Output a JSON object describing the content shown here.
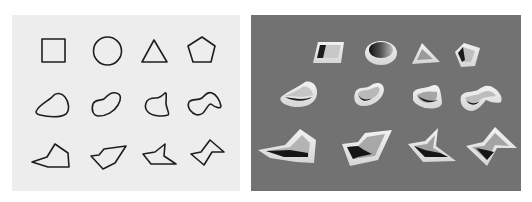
{
  "figure": {
    "left_panel": {
      "description": "2D outline shapes",
      "background": "#ededed",
      "stroke": "#1e1e1e",
      "rows": [
        [
          "square",
          "circle",
          "triangle",
          "pentagon"
        ],
        [
          "blob-1",
          "blob-2",
          "blob-3",
          "blob-4"
        ],
        [
          "polygon-1",
          "polygon-2",
          "polygon-3",
          "polygon-4"
        ]
      ]
    },
    "right_panel": {
      "description": "3D rendered hollow shapes (extruded walls)",
      "background": "#727272",
      "wall_color": "#e8e8e8",
      "cavity_color": "#1a1a1a"
    }
  }
}
